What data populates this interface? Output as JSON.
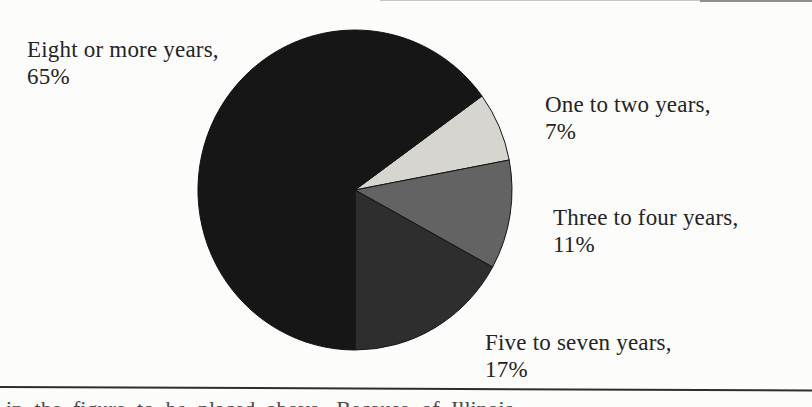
{
  "page": {
    "background_color": "#fcfcfa",
    "text_color": "#242424"
  },
  "chart_data": {
    "type": "pie",
    "title": "",
    "categories": [
      "One to two years",
      "Three to four years",
      "Five to seven years",
      "Eight or more years"
    ],
    "values": [
      7,
      11,
      17,
      65
    ],
    "unit": "%",
    "slices": [
      {
        "label": "One to two years",
        "value": 7,
        "color": "#d6d5d0"
      },
      {
        "label": "Three to four years",
        "value": 11,
        "color": "#636363"
      },
      {
        "label": "Five to seven years",
        "value": 17,
        "color": "#2e2e2e"
      },
      {
        "label": "Eight or more years",
        "value": 65,
        "color": "#161616"
      }
    ],
    "start_angle_deg": 36,
    "direction": "clockwise",
    "outline_color": "#141414",
    "legend_position": "none",
    "labels_outside": true
  },
  "labels": {
    "eight_or_more": {
      "line1": "Eight or more years,",
      "line2": "65%"
    },
    "one_to_two": {
      "line1": "One to two years,",
      "line2": "7%"
    },
    "three_to_four": {
      "line1": "Three to four years,",
      "line2": "11%"
    },
    "five_to_seven": {
      "line1": "Five to seven years,",
      "line2": "17%"
    }
  },
  "rules": {
    "top_faint_line_color": "#c6c6c4",
    "top_dark_segment_color": "#8f8f8d",
    "bottom_rule_color": "#2d2d2d"
  },
  "cropped_caption": {
    "fragment": "in the figure to be placed above. Because of Illinois"
  }
}
